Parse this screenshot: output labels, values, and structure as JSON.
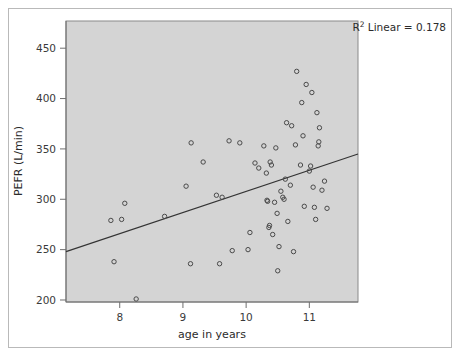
{
  "chart_data": {
    "type": "scatter",
    "title": "",
    "subtitle": "",
    "xlabel": "age in years",
    "ylabel": "PEFR (L/min)",
    "xlim": [
      7.15,
      11.77
    ],
    "ylim": [
      198,
      477
    ],
    "xticks": [
      8,
      9,
      10,
      11
    ],
    "xtick_labels": [
      "8",
      "9",
      "10",
      "11"
    ],
    "yticks": [
      200,
      250,
      300,
      350,
      400,
      450
    ],
    "ytick_labels": [
      "200",
      "250",
      "300",
      "350",
      "400",
      "450"
    ],
    "grid": false,
    "legend": false,
    "plot_background": "#d4d4d4",
    "marker_color": "#4a4a4a",
    "marker_fill": "none",
    "marker_size": 4.4,
    "marker_shape": "circle-open",
    "annotation": {
      "text_prefix": "R",
      "text_sup": "2",
      "text_suffix": " Linear = 0.178",
      "full_text": "R2 Linear = 0.178",
      "r_squared": 0.178,
      "position": "top-right"
    },
    "fit_line": {
      "type": "linear",
      "color": "#333333",
      "width": 1.1,
      "x_start": 7.15,
      "y_start": 248,
      "x_end": 11.77,
      "y_end": 345,
      "slope": 21.0,
      "intercept": 97.9
    },
    "points": [
      [
        7.86,
        279
      ],
      [
        7.91,
        238
      ],
      [
        8.03,
        280
      ],
      [
        8.08,
        296
      ],
      [
        8.26,
        201
      ],
      [
        8.71,
        283
      ],
      [
        9.05,
        313
      ],
      [
        9.12,
        236
      ],
      [
        9.13,
        356
      ],
      [
        9.32,
        337
      ],
      [
        9.53,
        304
      ],
      [
        9.58,
        236
      ],
      [
        9.62,
        302
      ],
      [
        9.73,
        358
      ],
      [
        9.78,
        249
      ],
      [
        9.9,
        356
      ],
      [
        10.03,
        250
      ],
      [
        10.06,
        267
      ],
      [
        10.14,
        336
      ],
      [
        10.2,
        331
      ],
      [
        10.28,
        353
      ],
      [
        10.32,
        326
      ],
      [
        10.33,
        299
      ],
      [
        10.34,
        298
      ],
      [
        10.36,
        272
      ],
      [
        10.37,
        274
      ],
      [
        10.38,
        337
      ],
      [
        10.4,
        334
      ],
      [
        10.42,
        265
      ],
      [
        10.45,
        297
      ],
      [
        10.47,
        351
      ],
      [
        10.49,
        286
      ],
      [
        10.5,
        229
      ],
      [
        10.52,
        253
      ],
      [
        10.55,
        308
      ],
      [
        10.58,
        302
      ],
      [
        10.6,
        300
      ],
      [
        10.62,
        320
      ],
      [
        10.64,
        376
      ],
      [
        10.66,
        278
      ],
      [
        10.7,
        314
      ],
      [
        10.72,
        373
      ],
      [
        10.75,
        248
      ],
      [
        10.78,
        354
      ],
      [
        10.8,
        427
      ],
      [
        10.86,
        334
      ],
      [
        10.88,
        396
      ],
      [
        10.9,
        363
      ],
      [
        10.92,
        293
      ],
      [
        10.95,
        414
      ],
      [
        11.0,
        328
      ],
      [
        11.02,
        333
      ],
      [
        11.04,
        406
      ],
      [
        11.06,
        312
      ],
      [
        11.08,
        292
      ],
      [
        11.1,
        280
      ],
      [
        11.12,
        386
      ],
      [
        11.14,
        353
      ],
      [
        11.15,
        357
      ],
      [
        11.16,
        371
      ],
      [
        11.2,
        309
      ],
      [
        11.24,
        318
      ],
      [
        11.28,
        291
      ]
    ]
  }
}
